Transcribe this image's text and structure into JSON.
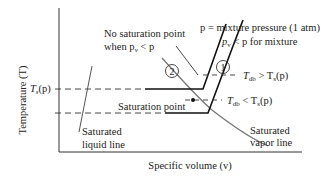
{
  "diagram": {
    "axes": {
      "y_label": "Temperature (T)",
      "x_label": "Specific volume (v)"
    },
    "labels": {
      "ts_tick": "T",
      "ts_tick_sub": "s",
      "ts_tick_arg": "(p)",
      "no_saturation_line1": "No saturation point",
      "no_saturation_line2_prefix": "when p",
      "no_saturation_line2_sub": "v",
      "no_saturation_line2_suffix": " < p",
      "mixture_pressure": "p = mixture pressure (1 atm)",
      "pv_less_p_prefix": "p",
      "pv_less_p_sub": "v",
      "pv_less_p_suffix": " < p for mixture",
      "tdb_greater_prefix": "T",
      "tdb_greater_sub": "db",
      "tdb_greater_mid": " > T",
      "tdb_greater_sub2": "s",
      "tdb_greater_suffix": "(p)",
      "tdb_less_prefix": "T",
      "tdb_less_sub": "db",
      "tdb_less_mid": " < T",
      "tdb_less_sub2": "s",
      "tdb_less_suffix": "(p)",
      "saturation_point": "Saturation point",
      "sat_liquid_line1": "Saturated",
      "sat_liquid_line2": "liquid line",
      "sat_vapor_line1": "Saturated",
      "sat_vapor_line2": "vapor line",
      "state_1": "1",
      "state_2": "2"
    },
    "colors": {
      "line": "#222222",
      "curve": "#666666",
      "dash": "#333333"
    }
  }
}
